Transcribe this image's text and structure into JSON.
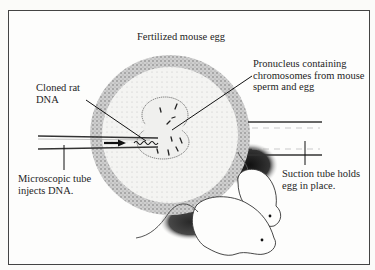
{
  "figure": {
    "title": "Fertilized mouse egg",
    "labels": {
      "cloned_rat_dna": [
        "Cloned rat",
        "DNA"
      ],
      "pronucleus": [
        "Pronucleus containing",
        "chromosomes from mouse",
        "sperm and egg"
      ],
      "microscopic_tube": [
        "Microscopic tube",
        "injects DNA."
      ],
      "suction_tube": [
        "Suction tube holds",
        "egg in place."
      ]
    },
    "elements": [
      "fertilized-egg",
      "pronucleus",
      "injection-micropipette",
      "suction-holding-pipette",
      "mice"
    ],
    "colors": {
      "ink": "#1e1e1e",
      "stipple": "#9a9a9a",
      "paper": "#fdfdfc"
    }
  }
}
